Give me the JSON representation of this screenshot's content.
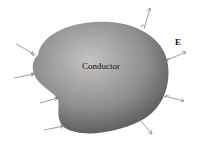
{
  "diagram": {
    "conductor_label": "Conductor",
    "field_label": "E",
    "colors": {
      "conductor_light": "#bdbdbd",
      "conductor_dark": "#5a5a5a",
      "field_line": "#777777",
      "background": "#ffffff"
    },
    "field_lines": [
      {
        "side": "top-right",
        "direction": "outward"
      },
      {
        "side": "right",
        "direction": "outward"
      },
      {
        "side": "right-lower",
        "direction": "outward"
      },
      {
        "side": "bottom-right",
        "direction": "outward"
      },
      {
        "side": "left-upper",
        "direction": "inward"
      },
      {
        "side": "left",
        "direction": "inward"
      },
      {
        "side": "left-lower",
        "direction": "inward"
      },
      {
        "side": "bottom-left",
        "direction": "inward"
      }
    ]
  }
}
